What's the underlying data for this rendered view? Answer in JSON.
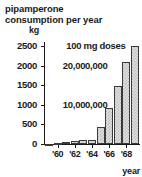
{
  "chart_data": {
    "type": "bar",
    "title": "pipamperone consumption per year",
    "title_lines": [
      "pipamperone",
      "consumption per year"
    ],
    "xlabel": "year",
    "ylabel": "kg",
    "ylim": [
      0,
      2600
    ],
    "xlim": [
      1958.4,
      1969.6
    ],
    "grid": false,
    "legend": null,
    "yticks": [
      0,
      500,
      1000,
      1500,
      2000,
      2500
    ],
    "ytick_labels": [
      "0",
      "500",
      "1000",
      "1500",
      "2000",
      "2500"
    ],
    "xticks": [
      1960,
      1962,
      1964,
      1966,
      1968
    ],
    "xtick_labels": [
      "'60",
      "'62",
      "'64",
      "'66",
      "'68"
    ],
    "categories": [
      1959,
      1960,
      1961,
      1962,
      1963,
      1964,
      1965,
      1966,
      1967,
      1968,
      1969
    ],
    "values": [
      10,
      20,
      60,
      80,
      95,
      110,
      430,
      930,
      1480,
      2080,
      2500
    ],
    "annotations": [
      {
        "text": "100 mg doses",
        "x": 1961.0,
        "y": 2500
      },
      {
        "text": "20,000,000",
        "x": 1960.6,
        "y": 2000
      },
      {
        "text": "10,000,000",
        "x": 1960.6,
        "y": 1000
      }
    ]
  },
  "figure": {
    "title_lines": [
      "pipamperone",
      "consumption per year"
    ],
    "unit_label": "kg",
    "x_axis_title": "year"
  }
}
